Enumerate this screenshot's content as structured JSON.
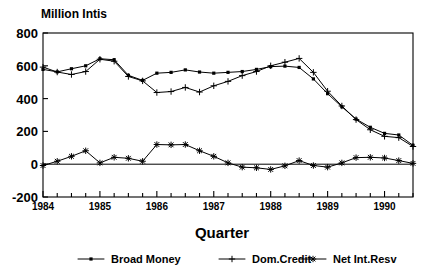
{
  "chart_data": {
    "type": "line",
    "title": "",
    "unit_label": "Million Intis",
    "xlabel": "Quarter",
    "ylabel": "",
    "ylim": [
      -200,
      800
    ],
    "yticks": [
      -200,
      0,
      200,
      400,
      600,
      800
    ],
    "ytick_labels": [
      "-200",
      "0",
      "200",
      "400",
      "600",
      "800"
    ],
    "xlim_quarters": [
      "1984Q1",
      "1990Q3"
    ],
    "xtick_labels": [
      "1984",
      "1985",
      "1986",
      "1987",
      "1988",
      "1989",
      "1990"
    ],
    "xtick_quarters": [
      "1984Q1",
      "1985Q1",
      "1986Q1",
      "1987Q1",
      "1988Q1",
      "1989Q1",
      "1990Q1"
    ],
    "grid": false,
    "legend_position": "below",
    "x": [
      "1984Q1",
      "1984Q2",
      "1984Q3",
      "1984Q4",
      "1985Q1",
      "1985Q2",
      "1985Q3",
      "1985Q4",
      "1986Q1",
      "1986Q2",
      "1986Q3",
      "1986Q4",
      "1987Q1",
      "1987Q2",
      "1987Q3",
      "1987Q4",
      "1988Q1",
      "1988Q2",
      "1988Q3",
      "1988Q4",
      "1989Q1",
      "1989Q2",
      "1989Q3",
      "1989Q4",
      "1990Q1",
      "1990Q2",
      "1990Q3"
    ],
    "series": [
      {
        "name": "Broad Money",
        "marker": "dot",
        "values": [
          578,
          563,
          582,
          600,
          643,
          637,
          542,
          511,
          555,
          560,
          575,
          562,
          555,
          560,
          565,
          578,
          595,
          598,
          590,
          520,
          430,
          350,
          275,
          225,
          188,
          178,
          115
        ]
      },
      {
        "name": "Dom.Credit",
        "marker": "plus",
        "values": [
          592,
          562,
          547,
          565,
          640,
          628,
          535,
          508,
          437,
          443,
          468,
          440,
          478,
          505,
          540,
          565,
          600,
          622,
          645,
          560,
          445,
          355,
          272,
          210,
          170,
          162,
          108
        ]
      },
      {
        "name": "Net Int.Resv",
        "marker": "star",
        "values": [
          -8,
          18,
          48,
          82,
          8,
          42,
          36,
          18,
          120,
          118,
          120,
          82,
          48,
          8,
          -18,
          -22,
          -32,
          -10,
          22,
          -8,
          -18,
          8,
          40,
          42,
          38,
          22,
          5
        ]
      }
    ]
  },
  "legend": {
    "items": [
      {
        "label": "Broad Money",
        "marker": "dot"
      },
      {
        "label": "Dom.Credit",
        "marker": "plus"
      },
      {
        "label": "Net Int.Resv",
        "marker": "star"
      }
    ]
  }
}
